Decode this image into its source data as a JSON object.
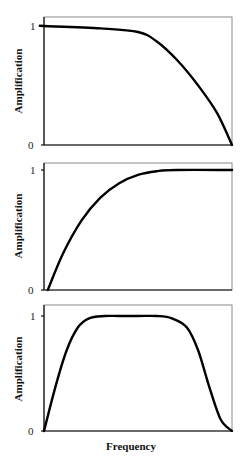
{
  "chart_data": [
    {
      "type": "line",
      "title": "",
      "xlabel": "",
      "ylabel": "Amplification",
      "yticks": [
        "0",
        "1"
      ],
      "ylim": [
        0,
        1
      ],
      "xlim": [
        0,
        1
      ],
      "grid": false,
      "legend": null,
      "series": [
        {
          "name": "low-pass",
          "x": [
            0,
            0.3,
            0.5,
            0.6,
            0.71,
            0.82,
            0.92,
            1.0
          ],
          "y": [
            1.0,
            1.0,
            0.98,
            0.95,
            0.87,
            0.71,
            0.5,
            0.27,
            0.0
          ]
        }
      ]
    },
    {
      "type": "line",
      "title": "",
      "xlabel": "",
      "ylabel": "Amplification",
      "yticks": [
        "0",
        "1"
      ],
      "ylim": [
        0,
        1
      ],
      "xlim": [
        0,
        1
      ],
      "grid": false,
      "legend": null,
      "series": [
        {
          "name": "high-pass",
          "x": [
            0.02,
            0.1,
            0.2,
            0.3,
            0.4,
            0.5,
            0.6,
            0.7,
            1.0
          ],
          "y": [
            0.0,
            0.3,
            0.58,
            0.77,
            0.89,
            0.96,
            0.99,
            1.0,
            1.0
          ]
        }
      ]
    },
    {
      "type": "line",
      "title": "",
      "xlabel": "Frequency",
      "ylabel": "Amplification",
      "yticks": [
        "0",
        "1"
      ],
      "ylim": [
        0,
        1
      ],
      "xlim": [
        0,
        1
      ],
      "grid": false,
      "legend": null,
      "series": [
        {
          "name": "band-pass",
          "x": [
            0.0,
            0.06,
            0.12,
            0.18,
            0.24,
            0.32,
            0.4,
            0.5,
            0.6,
            0.68,
            0.76,
            0.82,
            0.88,
            0.94,
            1.0
          ],
          "y": [
            0.0,
            0.38,
            0.7,
            0.9,
            0.98,
            1.0,
            1.0,
            1.0,
            1.0,
            0.98,
            0.9,
            0.7,
            0.38,
            0.1,
            0.0
          ]
        }
      ]
    }
  ],
  "labels": {
    "y_axis": "Amplification",
    "x_axis": "Frequency",
    "tick_one": "1",
    "tick_zero": "0"
  }
}
